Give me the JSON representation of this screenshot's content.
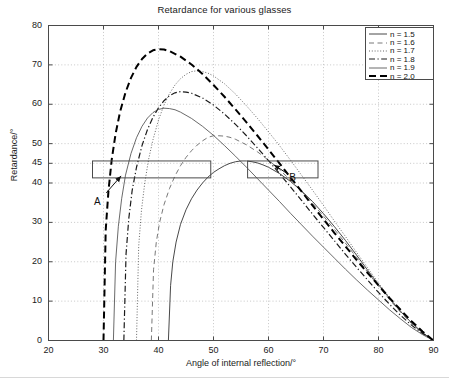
{
  "chart_data": {
    "type": "line",
    "title": "Retardance for various glasses",
    "xlabel": "Angle of internal reflection/°",
    "ylabel": "Retardance/°",
    "xlim": [
      20,
      90
    ],
    "ylim": [
      0,
      80
    ],
    "xticks": [
      20,
      30,
      40,
      50,
      60,
      70,
      80,
      90
    ],
    "yticks": [
      0,
      10,
      20,
      30,
      40,
      45,
      50,
      60,
      70,
      80
    ],
    "grid": true,
    "legend_position": "top-right",
    "series": [
      {
        "name": "n = 1.5",
        "style": "solid",
        "color": "#333333",
        "width": 0.9,
        "critical_angle": 41.8,
        "peak_x": 54.5,
        "peak_y": 45.6,
        "points": [
          [
            41.8,
            0
          ],
          [
            42.2,
            14
          ],
          [
            42.6,
            20
          ],
          [
            43.2,
            25
          ],
          [
            44.0,
            29.5
          ],
          [
            45.0,
            33.2
          ],
          [
            46.0,
            36.0
          ],
          [
            47.0,
            38.2
          ],
          [
            48.0,
            40.0
          ],
          [
            49.0,
            41.5
          ],
          [
            50.0,
            42.7
          ],
          [
            51.0,
            43.6
          ],
          [
            52.0,
            44.4
          ],
          [
            53.0,
            45.0
          ],
          [
            54.0,
            45.4
          ],
          [
            55.0,
            45.6
          ],
          [
            56.0,
            45.6
          ],
          [
            57.0,
            45.4
          ],
          [
            58.0,
            45.1
          ],
          [
            59.0,
            44.6
          ],
          [
            60.0,
            44.0
          ],
          [
            62.0,
            42.4
          ],
          [
            64.0,
            40.4
          ],
          [
            66.0,
            38.0
          ],
          [
            68.0,
            35.3
          ],
          [
            70.0,
            32.2
          ],
          [
            72.0,
            28.9
          ],
          [
            74.0,
            25.4
          ],
          [
            76.0,
            21.7
          ],
          [
            78.0,
            17.9
          ],
          [
            80.0,
            14.2
          ],
          [
            82.0,
            10.7
          ],
          [
            84.0,
            7.4
          ],
          [
            86.0,
            4.5
          ],
          [
            88.0,
            2.0
          ],
          [
            90.0,
            0
          ]
        ]
      },
      {
        "name": "n = 1.6",
        "style": "dashed-thin",
        "color": "#555555",
        "width": 0.8,
        "critical_angle": 38.7,
        "peak_x": 49.5,
        "peak_y": 52.0,
        "points": [
          [
            38.7,
            0
          ],
          [
            39.1,
            18
          ],
          [
            39.6,
            25
          ],
          [
            40.2,
            30
          ],
          [
            41.0,
            34.5
          ],
          [
            42.0,
            38.6
          ],
          [
            43.0,
            41.8
          ],
          [
            44.0,
            44.4
          ],
          [
            45.0,
            46.5
          ],
          [
            46.0,
            48.2
          ],
          [
            47.0,
            49.6
          ],
          [
            48.0,
            50.7
          ],
          [
            49.0,
            51.6
          ],
          [
            50.0,
            52.0
          ],
          [
            51.0,
            52.0
          ],
          [
            52.0,
            51.9
          ],
          [
            53.0,
            51.6
          ],
          [
            54.0,
            51.1
          ],
          [
            56.0,
            49.7
          ],
          [
            58.0,
            47.9
          ],
          [
            60.0,
            45.8
          ],
          [
            62.0,
            43.4
          ],
          [
            64.0,
            40.7
          ],
          [
            66.0,
            37.9
          ],
          [
            68.0,
            34.8
          ],
          [
            70.0,
            31.6
          ],
          [
            72.0,
            28.2
          ],
          [
            74.0,
            24.7
          ],
          [
            76.0,
            21.1
          ],
          [
            78.0,
            17.4
          ],
          [
            80.0,
            13.8
          ],
          [
            82.0,
            10.4
          ],
          [
            84.0,
            7.2
          ],
          [
            86.0,
            4.3
          ],
          [
            88.0,
            1.9
          ],
          [
            90.0,
            0
          ]
        ]
      },
      {
        "name": "n = 1.7",
        "style": "dotted",
        "color": "#666666",
        "width": 1.0,
        "critical_angle": 36.0,
        "peak_x": 46.5,
        "peak_y": 68.5,
        "points": [
          [
            36.0,
            0
          ],
          [
            36.4,
            24
          ],
          [
            36.9,
            33
          ],
          [
            37.5,
            40
          ],
          [
            38.2,
            46
          ],
          [
            39.0,
            51
          ],
          [
            40.0,
            56
          ],
          [
            41.0,
            59.8
          ],
          [
            42.0,
            62.7
          ],
          [
            43.0,
            64.9
          ],
          [
            44.0,
            66.5
          ],
          [
            45.0,
            67.6
          ],
          [
            46.0,
            68.3
          ],
          [
            47.0,
            68.5
          ],
          [
            48.0,
            68.3
          ],
          [
            49.0,
            67.9
          ],
          [
            50.0,
            67.2
          ],
          [
            52.0,
            65.2
          ],
          [
            54.0,
            62.6
          ],
          [
            56.0,
            59.6
          ],
          [
            58.0,
            56.4
          ],
          [
            60.0,
            53.0
          ],
          [
            62.0,
            49.5
          ],
          [
            64.0,
            45.8
          ],
          [
            66.0,
            42.0
          ],
          [
            68.0,
            38.2
          ],
          [
            70.0,
            34.3
          ],
          [
            72.0,
            30.3
          ],
          [
            74.0,
            26.4
          ],
          [
            76.0,
            22.4
          ],
          [
            78.0,
            18.5
          ],
          [
            80.0,
            14.6
          ],
          [
            82.0,
            10.9
          ],
          [
            84.0,
            7.5
          ],
          [
            86.0,
            4.5
          ],
          [
            88.0,
            2.0
          ],
          [
            90.0,
            0
          ]
        ]
      },
      {
        "name": "n = 1.8",
        "style": "dash-dot",
        "color": "#1a1a1a",
        "width": 1.2,
        "critical_angle": 33.7,
        "peak_x": 44.0,
        "peak_y": 63.2,
        "points": [
          [
            33.7,
            0
          ],
          [
            34.1,
            22
          ],
          [
            34.6,
            31
          ],
          [
            35.2,
            38
          ],
          [
            36.0,
            44
          ],
          [
            37.0,
            49.5
          ],
          [
            38.0,
            53.6
          ],
          [
            39.0,
            56.7
          ],
          [
            40.0,
            59.1
          ],
          [
            41.0,
            60.9
          ],
          [
            42.0,
            62.2
          ],
          [
            43.0,
            62.9
          ],
          [
            44.0,
            63.2
          ],
          [
            45.0,
            63.1
          ],
          [
            46.0,
            62.8
          ],
          [
            48.0,
            61.6
          ],
          [
            50.0,
            59.8
          ],
          [
            52.0,
            57.5
          ],
          [
            54.0,
            54.9
          ],
          [
            56.0,
            52.0
          ],
          [
            58.0,
            48.9
          ],
          [
            60.0,
            45.7
          ],
          [
            62.0,
            42.4
          ],
          [
            64.0,
            39.0
          ],
          [
            66.0,
            35.6
          ],
          [
            68.0,
            32.1
          ],
          [
            70.0,
            28.7
          ],
          [
            72.0,
            25.3
          ],
          [
            74.0,
            21.9
          ],
          [
            76.0,
            18.6
          ],
          [
            78.0,
            15.4
          ],
          [
            80.0,
            12.2
          ],
          [
            82.0,
            9.2
          ],
          [
            84.0,
            6.4
          ],
          [
            86.0,
            3.9
          ],
          [
            88.0,
            1.8
          ],
          [
            90.0,
            0
          ]
        ]
      },
      {
        "name": "n = 1.9",
        "style": "solid-thin",
        "color": "#444444",
        "width": 0.8,
        "critical_angle": 31.8,
        "peak_x": 41.5,
        "peak_y": 59.0,
        "points": [
          [
            31.8,
            0
          ],
          [
            32.2,
            20
          ],
          [
            32.7,
            29
          ],
          [
            33.3,
            36
          ],
          [
            34.0,
            42
          ],
          [
            35.0,
            47.5
          ],
          [
            36.0,
            51.5
          ],
          [
            37.0,
            54.4
          ],
          [
            38.0,
            56.5
          ],
          [
            39.0,
            57.9
          ],
          [
            40.0,
            58.7
          ],
          [
            41.0,
            59.0
          ],
          [
            42.0,
            58.9
          ],
          [
            43.0,
            58.6
          ],
          [
            44.0,
            58.0
          ],
          [
            46.0,
            56.4
          ],
          [
            48.0,
            54.4
          ],
          [
            50.0,
            52.1
          ],
          [
            52.0,
            49.5
          ],
          [
            54.0,
            46.8
          ],
          [
            56.0,
            44.0
          ],
          [
            58.0,
            41.1
          ],
          [
            60.0,
            38.2
          ],
          [
            62.0,
            35.3
          ],
          [
            64.0,
            32.3
          ],
          [
            66.0,
            29.4
          ],
          [
            68.0,
            26.5
          ],
          [
            70.0,
            23.7
          ],
          [
            72.0,
            20.9
          ],
          [
            74.0,
            18.1
          ],
          [
            76.0,
            15.4
          ],
          [
            78.0,
            12.8
          ],
          [
            80.0,
            10.3
          ],
          [
            82.0,
            7.8
          ],
          [
            84.0,
            5.5
          ],
          [
            86.0,
            3.3
          ],
          [
            88.0,
            1.5
          ],
          [
            90.0,
            0
          ]
        ]
      },
      {
        "name": "n = 2.0",
        "style": "dashed-thick",
        "color": "#000000",
        "width": 2.0,
        "critical_angle": 30.0,
        "peak_x": 39.5,
        "peak_y": 74.0,
        "points": [
          [
            30.0,
            0
          ],
          [
            30.4,
            28
          ],
          [
            30.9,
            38
          ],
          [
            31.5,
            46
          ],
          [
            32.2,
            52.5
          ],
          [
            33.0,
            58
          ],
          [
            34.0,
            63
          ],
          [
            35.0,
            66.7
          ],
          [
            36.0,
            69.5
          ],
          [
            37.0,
            71.5
          ],
          [
            38.0,
            72.9
          ],
          [
            39.0,
            73.7
          ],
          [
            40.0,
            74.0
          ],
          [
            41.0,
            73.9
          ],
          [
            42.0,
            73.5
          ],
          [
            44.0,
            72.1
          ],
          [
            46.0,
            70.1
          ],
          [
            48.0,
            67.7
          ],
          [
            50.0,
            64.9
          ],
          [
            52.0,
            61.9
          ],
          [
            54.0,
            58.7
          ],
          [
            56.0,
            55.4
          ],
          [
            58.0,
            52.0
          ],
          [
            60.0,
            48.5
          ],
          [
            62.0,
            45.0
          ],
          [
            64.0,
            41.4
          ],
          [
            66.0,
            37.9
          ],
          [
            68.0,
            34.3
          ],
          [
            70.0,
            30.8
          ],
          [
            72.0,
            27.3
          ],
          [
            74.0,
            23.9
          ],
          [
            76.0,
            20.5
          ],
          [
            78.0,
            17.2
          ],
          [
            80.0,
            14.0
          ],
          [
            82.0,
            10.8
          ],
          [
            84.0,
            7.8
          ],
          [
            86.0,
            4.9
          ],
          [
            88.0,
            2.3
          ],
          [
            90.0,
            0
          ]
        ]
      }
    ],
    "annotations": [
      {
        "label": "A",
        "label_x": 29.0,
        "label_y": 35.0,
        "arrow_from_x": 30.5,
        "arrow_from_y": 37.5,
        "arrow_to_x": 33.2,
        "arrow_to_y": 41.8
      },
      {
        "label": "B",
        "label_x": 64.5,
        "label_y": 41.0,
        "arrow_from_x": 63.5,
        "arrow_from_y": 42.3,
        "arrow_to_x": 61.0,
        "arrow_to_y": 44.6
      }
    ],
    "boxes": [
      {
        "x0": 28.0,
        "x1": 49.5,
        "y0": 41.3,
        "y1": 45.6
      },
      {
        "x0": 56.2,
        "x1": 69.0,
        "y0": 41.3,
        "y1": 45.6
      }
    ]
  },
  "legend": {
    "entries": [
      {
        "label": "n = 1.5"
      },
      {
        "label": "n = 1.6"
      },
      {
        "label": "n = 1.7"
      },
      {
        "label": "n = 1.8"
      },
      {
        "label": "n = 1.9"
      },
      {
        "label": "n = 2.0"
      }
    ]
  },
  "colors": {
    "axis": "#4a4a4a",
    "grid": "#b9b9b9",
    "text": "#1a1a1a",
    "background": "#ffffff"
  }
}
